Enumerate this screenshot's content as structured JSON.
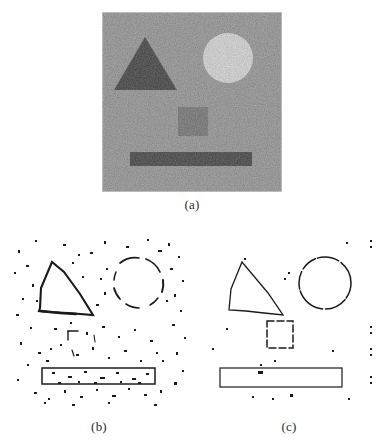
{
  "figure": {
    "background_color": "#ffffff",
    "ink_color": "#1a1a1a"
  },
  "panels": [
    {
      "id": "a",
      "caption": "(a)",
      "role": "source-noisy-image",
      "description": "Noisy grayscale image containing four geometric objects",
      "frame": {
        "x": 102,
        "y": 12,
        "width": 180,
        "height": 180
      },
      "background_gray": "#a8a8a8",
      "noise": {
        "type": "gaussian-speckle",
        "amount": "heavy"
      },
      "objects": [
        {
          "name": "dark-triangle",
          "shape": "triangle",
          "fill": "#3c3c3c",
          "points": "43,25 12,78 75,78",
          "description": "Dark solid triangle, upper left"
        },
        {
          "name": "bright-circle",
          "shape": "circle",
          "fill": "#fbfbfb",
          "cx": 126,
          "cy": 46,
          "r": 25,
          "description": "Bright white disk, upper right"
        },
        {
          "name": "gray-square",
          "shape": "square",
          "fill": "#7e7e7e",
          "x": 76,
          "y": 95,
          "width": 30,
          "height": 29,
          "description": "Mid-gray square, low contrast, center"
        },
        {
          "name": "dark-bar",
          "shape": "rectangle",
          "fill": "#3f3f3f",
          "x": 28,
          "y": 140,
          "width": 122,
          "height": 14,
          "description": "Dark horizontal bar, bottom"
        }
      ]
    },
    {
      "id": "b",
      "caption": "(b)",
      "role": "edge-map-noisy",
      "description": "Edge detection result with many spurious noise responses; contours broken and cluttered",
      "frame": {
        "x": 8,
        "y": 232,
        "width": 182,
        "height": 178
      },
      "background_color": "#ffffff",
      "edge_color": "#1a1a1a",
      "quality": "noisy",
      "objects": [
        {
          "name": "triangle-contour",
          "shape": "triangle-outline",
          "points": "44,30 32,78 85,83",
          "completeness": "mostly complete, thick and ragged"
        },
        {
          "name": "circle-contour",
          "shape": "circle-outline",
          "cx": 130,
          "cy": 51,
          "r": 25,
          "completeness": "broken into arcs"
        },
        {
          "name": "square-contour",
          "shape": "square-outline",
          "x": 60,
          "y": 98,
          "width": 28,
          "height": 28,
          "completeness": "barely detected, a few fragments only"
        },
        {
          "name": "bar-contour",
          "shape": "rectangle-outline",
          "x": 34,
          "y": 136,
          "width": 113,
          "height": 16,
          "completeness": "complete but speckled with noise"
        }
      ],
      "spurious_points": 180
    },
    {
      "id": "c",
      "caption": "(c)",
      "role": "edge-map-clean",
      "description": "Edge detection result after noise suppression; clean closed contours with few spurious points",
      "frame": {
        "x": 198,
        "y": 232,
        "width": 182,
        "height": 178
      },
      "background_color": "#ffffff",
      "edge_color": "#1a1a1a",
      "quality": "clean",
      "objects": [
        {
          "name": "triangle-contour",
          "shape": "triangle-outline",
          "points": "44,30 32,78 85,83",
          "completeness": "complete, thin"
        },
        {
          "name": "circle-contour",
          "shape": "circle-outline",
          "cx": 127,
          "cy": 51,
          "r": 26,
          "completeness": "nearly complete, slightly dashed"
        },
        {
          "name": "square-contour",
          "shape": "square-outline",
          "x": 69,
          "y": 89,
          "width": 26,
          "height": 27,
          "completeness": "dashed outline, clearly visible"
        },
        {
          "name": "bar-contour",
          "shape": "rectangle-outline",
          "x": 22,
          "y": 136,
          "width": 122,
          "height": 19,
          "completeness": "complete, clean"
        }
      ],
      "spurious_points": 22
    }
  ]
}
